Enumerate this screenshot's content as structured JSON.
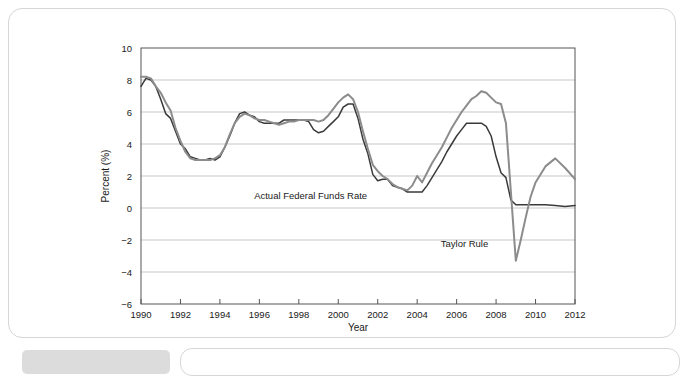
{
  "chart_data": {
    "type": "line",
    "title": "",
    "xlabel": "Year",
    "ylabel": "Percent (%)",
    "xlim": [
      1990,
      2012
    ],
    "ylim": [
      -6,
      10
    ],
    "grid": true,
    "legend_position": "inline-annotations",
    "x_ticks": [
      "1990",
      "1992",
      "1994",
      "1996",
      "1998",
      "2000",
      "2002",
      "2004",
      "2006",
      "2008",
      "2010",
      "2012"
    ],
    "y_ticks": [
      "10",
      "8",
      "6",
      "4",
      "2",
      "0",
      "-2",
      "-4",
      "-6"
    ],
    "annotations": [
      {
        "text": "Actual Federal Funds Rate",
        "x": 1998.6,
        "y": 0.55
      },
      {
        "text": "Taylor Rule",
        "x": 2006.4,
        "y": -2.45
      }
    ],
    "series": [
      {
        "name": "Actual Federal Funds Rate",
        "color": "#3a3a3a",
        "width": 1.5,
        "x": [
          1990.0,
          1990.25,
          1990.5,
          1990.75,
          1991.0,
          1991.25,
          1991.5,
          1991.75,
          1992.0,
          1992.25,
          1992.5,
          1992.75,
          1993.0,
          1993.25,
          1993.5,
          1993.75,
          1994.0,
          1994.25,
          1994.5,
          1994.75,
          1995.0,
          1995.25,
          1995.5,
          1995.75,
          1996.0,
          1996.25,
          1996.5,
          1996.75,
          1997.0,
          1997.25,
          1997.5,
          1997.75,
          1998.0,
          1998.25,
          1998.5,
          1998.75,
          1999.0,
          1999.25,
          1999.5,
          1999.75,
          2000.0,
          2000.25,
          2000.5,
          2000.75,
          2001.0,
          2001.25,
          2001.5,
          2001.75,
          2002.0,
          2002.25,
          2002.5,
          2002.75,
          2003.0,
          2003.25,
          2003.5,
          2003.75,
          2004.0,
          2004.25,
          2004.5,
          2004.75,
          2005.0,
          2005.25,
          2005.5,
          2005.75,
          2006.0,
          2006.25,
          2006.5,
          2006.75,
          2007.0,
          2007.25,
          2007.5,
          2007.75,
          2008.0,
          2008.25,
          2008.5,
          2008.75,
          2009.0,
          2009.25,
          2009.5,
          2009.75,
          2010.0,
          2010.5,
          2011.0,
          2011.5,
          2012.0
        ],
        "y": [
          7.6,
          8.1,
          8.0,
          7.6,
          6.8,
          5.9,
          5.6,
          4.8,
          4.0,
          3.7,
          3.2,
          3.1,
          3.0,
          3.0,
          3.1,
          3.0,
          3.2,
          3.8,
          4.5,
          5.3,
          5.9,
          6.0,
          5.8,
          5.7,
          5.4,
          5.3,
          5.3,
          5.3,
          5.3,
          5.5,
          5.5,
          5.5,
          5.5,
          5.5,
          5.4,
          4.9,
          4.7,
          4.8,
          5.1,
          5.4,
          5.7,
          6.3,
          6.5,
          6.5,
          5.6,
          4.3,
          3.4,
          2.1,
          1.7,
          1.8,
          1.8,
          1.4,
          1.3,
          1.2,
          1.0,
          1.0,
          1.0,
          1.0,
          1.4,
          1.9,
          2.4,
          2.9,
          3.5,
          4.0,
          4.5,
          4.9,
          5.3,
          5.3,
          5.3,
          5.3,
          5.1,
          4.5,
          3.2,
          2.2,
          1.9,
          0.5,
          0.2,
          0.2,
          0.2,
          0.2,
          0.2,
          0.2,
          0.15,
          0.1,
          0.15
        ]
      },
      {
        "name": "Taylor Rule",
        "color": "#8c8c8c",
        "width": 2.0,
        "x": [
          1990.0,
          1990.25,
          1990.5,
          1990.75,
          1991.0,
          1991.25,
          1991.5,
          1991.75,
          1992.0,
          1992.25,
          1992.5,
          1992.75,
          1993.0,
          1993.25,
          1993.5,
          1993.75,
          1994.0,
          1994.25,
          1994.5,
          1994.75,
          1995.0,
          1995.25,
          1995.5,
          1995.75,
          1996.0,
          1996.25,
          1996.5,
          1996.75,
          1997.0,
          1997.25,
          1997.5,
          1997.75,
          1998.0,
          1998.25,
          1998.5,
          1998.75,
          1999.0,
          1999.25,
          1999.5,
          1999.75,
          2000.0,
          2000.25,
          2000.5,
          2000.75,
          2001.0,
          2001.25,
          2001.5,
          2001.75,
          2002.0,
          2002.25,
          2002.5,
          2002.75,
          2003.0,
          2003.25,
          2003.5,
          2003.75,
          2004.0,
          2004.25,
          2004.5,
          2004.75,
          2005.0,
          2005.25,
          2005.5,
          2005.75,
          2006.0,
          2006.25,
          2006.5,
          2006.75,
          2007.0,
          2007.25,
          2007.5,
          2007.75,
          2008.0,
          2008.25,
          2008.5,
          2008.75,
          2009.0,
          2009.25,
          2009.5,
          2009.75,
          2010.0,
          2010.5,
          2011.0,
          2011.5,
          2012.0
        ],
        "y": [
          8.2,
          8.2,
          8.1,
          7.6,
          7.2,
          6.6,
          6.1,
          5.0,
          4.2,
          3.5,
          3.1,
          3.0,
          3.0,
          3.0,
          3.0,
          3.1,
          3.3,
          3.8,
          4.6,
          5.3,
          5.7,
          5.9,
          5.8,
          5.6,
          5.5,
          5.5,
          5.4,
          5.3,
          5.2,
          5.3,
          5.4,
          5.4,
          5.5,
          5.5,
          5.5,
          5.5,
          5.4,
          5.5,
          5.8,
          6.2,
          6.6,
          6.9,
          7.1,
          6.8,
          6.0,
          4.8,
          3.7,
          2.7,
          2.3,
          2.0,
          1.8,
          1.5,
          1.3,
          1.2,
          1.1,
          1.4,
          2.0,
          1.6,
          2.2,
          2.8,
          3.3,
          3.8,
          4.4,
          5.0,
          5.5,
          6.0,
          6.4,
          6.8,
          7.0,
          7.3,
          7.2,
          6.9,
          6.6,
          6.5,
          5.3,
          1.0,
          -3.3,
          -2.0,
          -0.6,
          0.7,
          1.6,
          2.6,
          3.1,
          2.5,
          1.8
        ]
      }
    ]
  },
  "figure": {
    "card_label": "figure-card"
  }
}
